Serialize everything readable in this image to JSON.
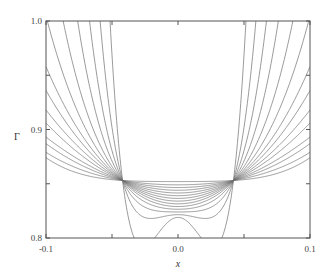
{
  "chart_data": {
    "type": "line",
    "title": "",
    "xlabel": "x",
    "ylabel": "Γ",
    "xlim": [
      -0.1,
      0.1
    ],
    "ylim": [
      0.8,
      1.0
    ],
    "grid": false,
    "legend": null,
    "x_ticks": [
      {
        "value": -0.1,
        "label": "-0.1"
      },
      {
        "value": 0.0,
        "label": "0.0"
      },
      {
        "value": 0.1,
        "label": "0.1"
      }
    ],
    "x_minor_ticks": [
      -0.05,
      0.05
    ],
    "y_ticks": [
      {
        "value": 0.8,
        "label": "0.8"
      },
      {
        "value": 0.9,
        "label": "0.9"
      },
      {
        "value": 1.0,
        "label": "1.0"
      }
    ],
    "y_minor_ticks": [
      0.85,
      0.95
    ],
    "convergence": {
      "x_abs": 0.042,
      "y": 0.853
    },
    "series_note": "14 symmetric curves; each defined by minimum at x=0 and the point where it leaves the plot (exit_x, exit_y)",
    "series": [
      {
        "name": "curve-1",
        "min": 0.819,
        "exit_x": 0.0515,
        "exit_y": 1.0,
        "values_at": {
          "x0": 0.819,
          "x005": 1.0,
          "x01": 1.0
        }
      },
      {
        "name": "curve-2",
        "min": 0.8215,
        "exit_x": 0.059,
        "exit_y": 1.0,
        "values_at": {
          "x0": 0.8215,
          "x005": 0.96,
          "x01": 1.0
        }
      },
      {
        "name": "curve-3",
        "min": 0.824,
        "exit_x": 0.067,
        "exit_y": 1.0,
        "values_at": {
          "x0": 0.824,
          "x005": 0.92,
          "x01": 1.0
        }
      },
      {
        "name": "curve-4",
        "min": 0.8265,
        "exit_x": 0.076,
        "exit_y": 1.0,
        "values_at": {
          "x0": 0.8265,
          "x005": 0.9,
          "x01": 1.0
        }
      },
      {
        "name": "curve-5",
        "min": 0.829,
        "exit_x": 0.087,
        "exit_y": 1.0,
        "values_at": {
          "x0": 0.829,
          "x005": 0.885,
          "x01": 1.0
        }
      },
      {
        "name": "curve-6",
        "min": 0.8315,
        "exit_x": 0.099,
        "exit_y": 1.0,
        "values_at": {
          "x0": 0.8315,
          "x005": 0.875,
          "x01": 1.0
        }
      },
      {
        "name": "curve-7",
        "min": 0.834,
        "exit_x": 0.1,
        "exit_y": 0.958,
        "values_at": {
          "x0": 0.834,
          "x005": 0.87,
          "x01": 0.958
        }
      },
      {
        "name": "curve-8",
        "min": 0.8365,
        "exit_x": 0.1,
        "exit_y": 0.936,
        "values_at": {
          "x0": 0.8365,
          "x005": 0.866,
          "x01": 0.936
        }
      },
      {
        "name": "curve-9",
        "min": 0.839,
        "exit_x": 0.1,
        "exit_y": 0.918,
        "values_at": {
          "x0": 0.839,
          "x005": 0.862,
          "x01": 0.918
        }
      },
      {
        "name": "curve-10",
        "min": 0.8415,
        "exit_x": 0.1,
        "exit_y": 0.906,
        "values_at": {
          "x0": 0.8415,
          "x005": 0.86,
          "x01": 0.906
        }
      },
      {
        "name": "curve-11",
        "min": 0.844,
        "exit_x": 0.1,
        "exit_y": 0.893,
        "values_at": {
          "x0": 0.844,
          "x005": 0.858,
          "x01": 0.893
        }
      },
      {
        "name": "curve-12",
        "min": 0.8465,
        "exit_x": 0.1,
        "exit_y": 0.887,
        "values_at": {
          "x0": 0.8465,
          "x005": 0.857,
          "x01": 0.887
        }
      },
      {
        "name": "curve-13",
        "min": 0.849,
        "exit_x": 0.1,
        "exit_y": 0.879,
        "values_at": {
          "x0": 0.849,
          "x005": 0.856,
          "x01": 0.879
        }
      },
      {
        "name": "curve-14",
        "min": 0.852,
        "exit_x": 0.1,
        "exit_y": 0.874,
        "values_at": {
          "x0": 0.852,
          "x005": 0.855,
          "x01": 0.874
        }
      }
    ]
  },
  "style": {
    "line_color": "#6e6e6e",
    "axis_color": "#555555",
    "background": "#ffffff"
  },
  "plot_box": {
    "left": 46,
    "top": 21,
    "right": 310,
    "bottom": 238
  }
}
